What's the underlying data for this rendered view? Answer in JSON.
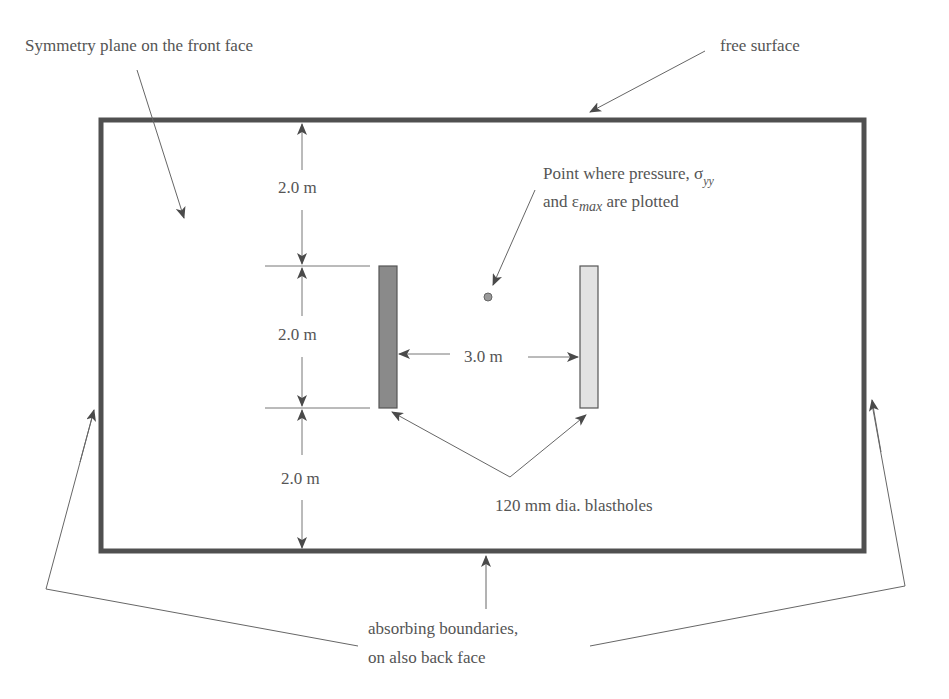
{
  "colors": {
    "frame": "#505050",
    "line": "#666666",
    "text": "#555555",
    "blasthole_left": "#8a8a8a",
    "blasthole_right": "#e2e2e2",
    "point": "#9a9a9a"
  },
  "labels": {
    "symmetry_plane": "Symmetry plane on the front face",
    "free_surface": "free surface",
    "point_line1": "Point where pressure, σ",
    "point_sub1": "yy",
    "point_line2_a": "and ε",
    "point_sub2": "max",
    "point_line2_b": " are plotted",
    "dim_top": "2.0 m",
    "dim_middle": "2.0 m",
    "dim_bottom": "2.0 m",
    "dim_spacing": "3.0 m",
    "blastholes": "120 mm dia. blastholes",
    "absorbing_line1": "absorbing boundaries,",
    "absorbing_line2": "on also back face"
  }
}
